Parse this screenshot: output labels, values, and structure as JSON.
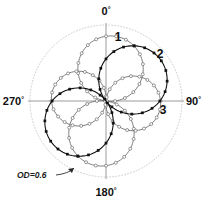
{
  "figure": {
    "name": "polar-radiation-pattern",
    "background": "#ffffff",
    "outer_circle_color": "#c8c8c8",
    "axis_color": "#8c8c8c"
  },
  "axis_labels": {
    "top": "0",
    "right": "90",
    "bottom": "180",
    "left": "270",
    "degree_symbol": "°"
  },
  "annotations": {
    "od_label": "OD=0.6",
    "leader_line": "pointer-from-od-label-to-circle"
  },
  "curve_labels": [
    {
      "text": "1",
      "x": 118,
      "y": 41
    },
    {
      "text": "2",
      "x": 160,
      "y": 58
    },
    {
      "text": "3",
      "x": 163,
      "y": 114
    }
  ],
  "chart_data": {
    "type": "line",
    "subtype": "polar",
    "title": "",
    "xlabel": "",
    "ylabel": "",
    "theta_unit": "degrees",
    "theta_zero_at": "top",
    "theta_direction": "clockwise",
    "r_range": [
      0,
      1
    ],
    "grid": false,
    "legend": "inline-numeric-labels",
    "outer_boundary": {
      "label": "OD=0.6",
      "r": 1.0,
      "style": "dotted-thin-gray"
    },
    "axes": {
      "angles": [
        0,
        90,
        180,
        270
      ],
      "tick_labels": [
        "0°",
        "90°",
        "180°",
        "270°"
      ]
    },
    "series": [
      {
        "name": "1",
        "label": "1",
        "marker": "open-circle",
        "marker_fill": "#ffffff",
        "color": "#6e6e6e",
        "lobe_axis_deg": 8,
        "peak_r": 0.86,
        "model": "abs_cos_dipole",
        "theta": [
          0,
          10,
          20,
          30,
          40,
          50,
          60,
          70,
          80,
          90,
          100,
          110,
          120,
          130,
          140,
          150,
          160,
          170,
          180,
          190,
          200,
          210,
          220,
          230,
          240,
          250,
          260,
          270,
          280,
          290,
          300,
          310,
          320,
          330,
          340,
          350
        ],
        "r": [
          0.85,
          0.84,
          0.8,
          0.74,
          0.65,
          0.55,
          0.43,
          0.3,
          0.16,
          0.03,
          0.12,
          0.27,
          0.41,
          0.54,
          0.65,
          0.74,
          0.81,
          0.85,
          0.86,
          0.85,
          0.81,
          0.74,
          0.65,
          0.54,
          0.41,
          0.27,
          0.12,
          0.03,
          0.16,
          0.3,
          0.43,
          0.55,
          0.65,
          0.74,
          0.8,
          0.84
        ]
      },
      {
        "name": "2",
        "label": "2",
        "marker": "filled-square",
        "marker_fill": "#111111",
        "color": "#111111",
        "lobe_axis_deg": 52,
        "peak_r": 0.9,
        "model": "abs_cos_dipole",
        "theta": [
          0,
          10,
          20,
          30,
          40,
          50,
          60,
          70,
          80,
          90,
          100,
          110,
          120,
          130,
          140,
          150,
          160,
          170,
          180,
          190,
          200,
          210,
          220,
          230,
          240,
          250,
          260,
          270,
          280,
          290,
          300,
          310,
          320,
          330,
          340,
          350
        ],
        "r": [
          0.55,
          0.68,
          0.79,
          0.86,
          0.9,
          0.9,
          0.86,
          0.79,
          0.68,
          0.55,
          0.4,
          0.24,
          0.08,
          0.09,
          0.24,
          0.4,
          0.55,
          0.68,
          0.79,
          0.86,
          0.9,
          0.9,
          0.86,
          0.79,
          0.68,
          0.55,
          0.4,
          0.24,
          0.08,
          0.09,
          0.24,
          0.4,
          0.55,
          0.68,
          0.79,
          0.86
        ]
      },
      {
        "name": "3",
        "label": "3",
        "marker": "open-circle",
        "marker_fill": "#ffffff",
        "color": "#6e6e6e",
        "lobe_axis_deg": 95,
        "peak_r": 0.72,
        "model": "abs_cos_dipole",
        "theta": [
          0,
          10,
          20,
          30,
          40,
          50,
          60,
          70,
          80,
          90,
          100,
          110,
          120,
          130,
          140,
          150,
          160,
          170,
          180,
          190,
          200,
          210,
          220,
          230,
          240,
          250,
          260,
          270,
          280,
          290,
          300,
          310,
          320,
          330,
          340,
          350
        ],
        "r": [
          0.06,
          0.19,
          0.31,
          0.42,
          0.52,
          0.61,
          0.67,
          0.71,
          0.72,
          0.72,
          0.7,
          0.65,
          0.58,
          0.49,
          0.39,
          0.27,
          0.15,
          0.02,
          0.1,
          0.23,
          0.35,
          0.46,
          0.55,
          0.63,
          0.69,
          0.72,
          0.72,
          0.71,
          0.67,
          0.61,
          0.52,
          0.42,
          0.31,
          0.19,
          0.06,
          0.06
        ]
      }
    ]
  }
}
